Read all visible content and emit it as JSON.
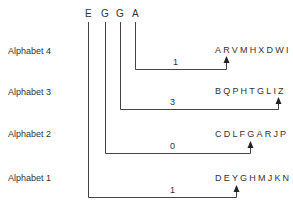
{
  "title_letters": [
    "E",
    "G",
    "G",
    "A"
  ],
  "rows": [
    {
      "label": "Alphabet 4",
      "sequence": "ARVMHXDWI",
      "number": "1"
    },
    {
      "label": "Alphabet 3",
      "sequence": "BQPHTGLIZ",
      "number": "3"
    },
    {
      "label": "Alphabet 2",
      "sequence": "CDLFGARJP",
      "number": "0"
    },
    {
      "label": "Alphabet 1",
      "sequence": "DEYGHMJKN",
      "number": "1"
    }
  ],
  "line_color": "#444444"
}
